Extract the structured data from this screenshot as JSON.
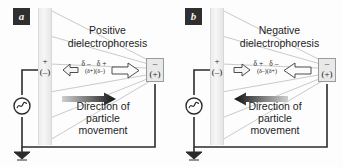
{
  "figure": {
    "type": "scientific-diagram",
    "background_color": "#fdfdfd",
    "panel_count": 2
  },
  "common": {
    "electrode_left": {
      "symbol_top": "+",
      "symbol_bottom": "(–)",
      "name": "planar-electrode"
    },
    "electrode_right": {
      "symbol_top": "–",
      "symbol_bottom": "(+)",
      "name": "point-electrode",
      "fill_color": "#e9e9e9",
      "border_color": "#9a9a9a"
    },
    "direction_label_line1": "Direction of",
    "direction_label_line2": "particle",
    "direction_label_line3": "movement",
    "ac_source_symbol": "∼",
    "ground_symbol": "ground",
    "wire_color": "#2b2b2b",
    "field_line_color": "#b9b9b9",
    "field_line_count": 6
  },
  "panels": [
    {
      "tag": "a",
      "title_line1": "Positive",
      "title_line2": "dielectrophoresis",
      "particle": {
        "charge_top_left": "δ–",
        "charge_top_right": "δ+",
        "charge_bottom_left": "(δ+)",
        "charge_bottom_right": "(δ–)"
      },
      "force_arrow_left_direction": "left",
      "force_arrow_right_direction": "right",
      "force_arrow_right_size": "large",
      "movement_arrow_direction": "right",
      "movement_arrow_color": "#1a1a1a"
    },
    {
      "tag": "b",
      "title_line1": "Negative",
      "title_line2": "dielectrophoresis",
      "particle": {
        "charge_top_left": "δ+",
        "charge_top_right": "δ–",
        "charge_bottom_left": "(δ–)",
        "charge_bottom_right": "(δ+)"
      },
      "force_arrow_left_direction": "right",
      "force_arrow_right_direction": "left",
      "force_arrow_right_size": "large",
      "movement_arrow_direction": "left",
      "movement_arrow_color": "#1a1a1a"
    }
  ]
}
